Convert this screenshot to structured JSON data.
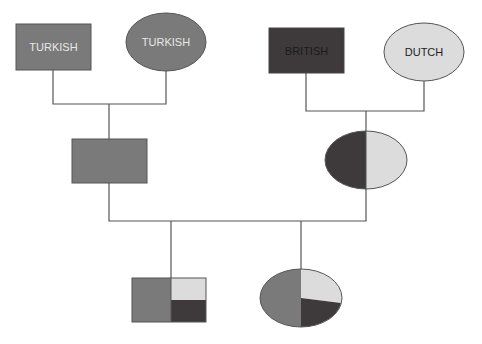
{
  "diagram": {
    "type": "family-tree-pedigree",
    "colors": {
      "turkish": "#7a7a7a",
      "british": "#3e3a3b",
      "dutch": "#dcdcdc",
      "line": "#555555",
      "label_light": "#e8e8e8",
      "label_dark": "#222222"
    },
    "grandparents": [
      {
        "id": "gp1",
        "shape": "square",
        "sex": "male",
        "label": "TURKISH",
        "ancestry": {
          "Turkish": 1.0
        }
      },
      {
        "id": "gp2",
        "shape": "circle",
        "sex": "female",
        "label": "TURKISH",
        "ancestry": {
          "Turkish": 1.0
        }
      },
      {
        "id": "gp3",
        "shape": "square",
        "sex": "male",
        "label": "BRITISH",
        "ancestry": {
          "British": 1.0
        }
      },
      {
        "id": "gp4",
        "shape": "circle",
        "sex": "female",
        "label": "DUTCH",
        "ancestry": {
          "Dutch": 1.0
        }
      }
    ],
    "parents": [
      {
        "id": "p1",
        "shape": "square",
        "sex": "male",
        "label": "",
        "ancestry": {
          "Turkish": 1.0
        }
      },
      {
        "id": "p2",
        "shape": "circle",
        "sex": "female",
        "label": "",
        "ancestry": {
          "British": 0.5,
          "Dutch": 0.5
        }
      }
    ],
    "children": [
      {
        "id": "c1",
        "shape": "square",
        "sex": "male",
        "label": "",
        "ancestry": {
          "Turkish": 0.5,
          "Dutch": 0.25,
          "British": 0.25
        }
      },
      {
        "id": "c2",
        "shape": "circle",
        "sex": "female",
        "label": "",
        "ancestry": {
          "Turkish": 0.5,
          "Dutch": 0.25,
          "British": 0.25
        }
      }
    ]
  }
}
